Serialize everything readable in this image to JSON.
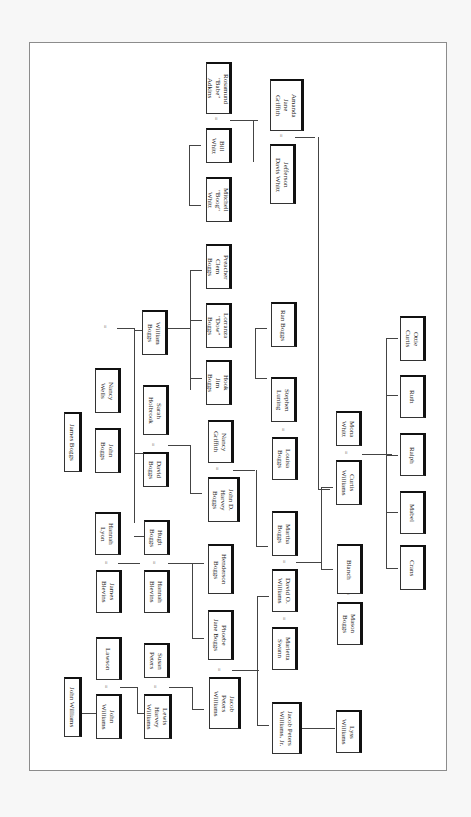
{
  "orientation": "rotated 90 degrees clockwise",
  "people": {
    "rosamund": "Rosamund\n\"Babe\"\nAdkins",
    "amanda": "Amanda\nJane\nGriffith",
    "bill_whitt": "Bill\nWhitt",
    "mitchell": "Mitchell\n\"Boog\"\nWhitt",
    "jefferson": "Jefferson\nDavis Whitt",
    "preacher": "Preacher\nClem\nBoggs",
    "lorranza": "Lorranza\n\"Dow\"\nBoggs",
    "hook": "Hook\nJim\nBoggs",
    "ran": "Ran Boggs",
    "stephen": "Stephen\nLuning",
    "william_boggs": "William\nBoggs",
    "nancy_wells": "Nancy\nWells",
    "sarah": "Sarah\nHolbrook",
    "james_boggs": "James Boggs",
    "john_boggs": "John\nBoggs",
    "david_boggs": "David\nBoggs",
    "nancy_griffith": "Nancy\nGriffith",
    "john_d": "John D.\nHarvey\nBoggs",
    "louisa": "Louisa\nBoggs",
    "mona": "Mona\nWhitt",
    "curtis": "Curtis\nWilliams",
    "ottie": "Ottie\nCurtis",
    "ruth": "Ruth",
    "ralph": "Ralph",
    "mabel": "Mabel",
    "crans": "Crans",
    "hannah_lyon": "Hannah\nLyon",
    "hugh": "Hugh\nBoggs",
    "martha": "Martha\nBoggs",
    "blanch": "Blanch",
    "henderson": "Henderson\nBoggs",
    "james_blevins": "James\nBlevins",
    "hannah_blevins": "Hannah\nBlevins",
    "david_o": "David O.\nWilliams",
    "mason": "Mason\nBoggs",
    "phoebe": "Phoebe\nJane Boggs",
    "marietta": "Marietta\nSwann",
    "lawson": "Lawson",
    "susan": "Susan\nPeters",
    "john_williams_sr": "John Williams",
    "john_williams": "John\nWilliams",
    "lewis": "Lewis\nHarvey\nWilliams",
    "jacob": "Jacob\nPeters\nWilliams",
    "jacob_jr": "Jacob Peters\nWilliams, Jr.",
    "lyss": "Lyss\nWilliams"
  },
  "marriage_symbol": "="
}
